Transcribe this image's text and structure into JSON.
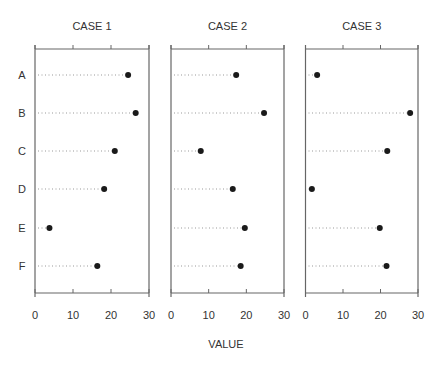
{
  "chart_data": {
    "type": "dot",
    "title": "",
    "xlabel": "VALUE",
    "ylabel": "",
    "categories": [
      "A",
      "B",
      "C",
      "D",
      "E",
      "F"
    ],
    "xlim": [
      0,
      30
    ],
    "xticks": [
      0,
      10,
      20,
      30
    ],
    "grid": false,
    "legend": null,
    "panels": [
      {
        "title": "CASE 1",
        "values": [
          24.5,
          26.5,
          21.0,
          18.2,
          3.8,
          16.4
        ]
      },
      {
        "title": "CASE 2",
        "values": [
          17.3,
          24.7,
          7.9,
          16.4,
          19.6,
          18.5
        ]
      },
      {
        "title": "CASE 3",
        "values": [
          3.1,
          27.9,
          21.8,
          1.7,
          19.8,
          21.6
        ]
      }
    ]
  },
  "colors": {
    "axis": "#666666",
    "dot": "#1a1a1a",
    "leader": "#999999",
    "text": "#333333"
  }
}
